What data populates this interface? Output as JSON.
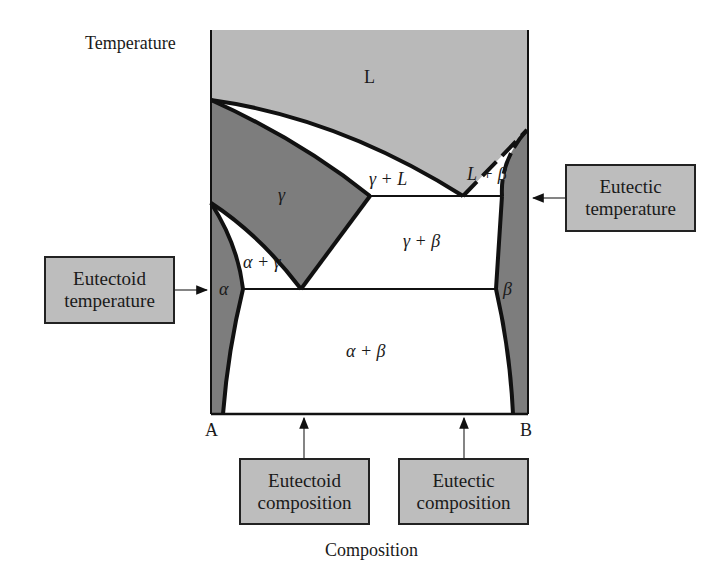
{
  "diagram": {
    "type": "binary phase diagram (eutectic + eutectoid)",
    "axes": {
      "y_label": "Temperature",
      "x_label": "Composition",
      "left_component": "A",
      "right_component": "B"
    },
    "regions": {
      "liquid": "L",
      "gamma": "γ",
      "gamma_plus_liquid": "γ + L",
      "liquid_plus_beta": "L + β",
      "gamma_plus_beta": "γ + β",
      "alpha_plus_gamma": "α + γ",
      "alpha": "α",
      "beta": "β",
      "alpha_plus_beta": "α + β"
    },
    "callouts": {
      "eutectic_temperature": [
        "Eutectic",
        "temperature"
      ],
      "eutectoid_temperature": [
        "Eutectoid",
        "temperature"
      ],
      "eutectoid_composition": [
        "Eutectoid",
        "composition"
      ],
      "eutectic_composition": [
        "Eutectic",
        "composition"
      ]
    },
    "colors": {
      "liquid_fill": "#b9b9b9",
      "solid_phase_fill": "#7d7d7d",
      "two_phase_fill": "#ffffff",
      "callout_fill": "#bdbdbd",
      "line": "#111111"
    }
  }
}
